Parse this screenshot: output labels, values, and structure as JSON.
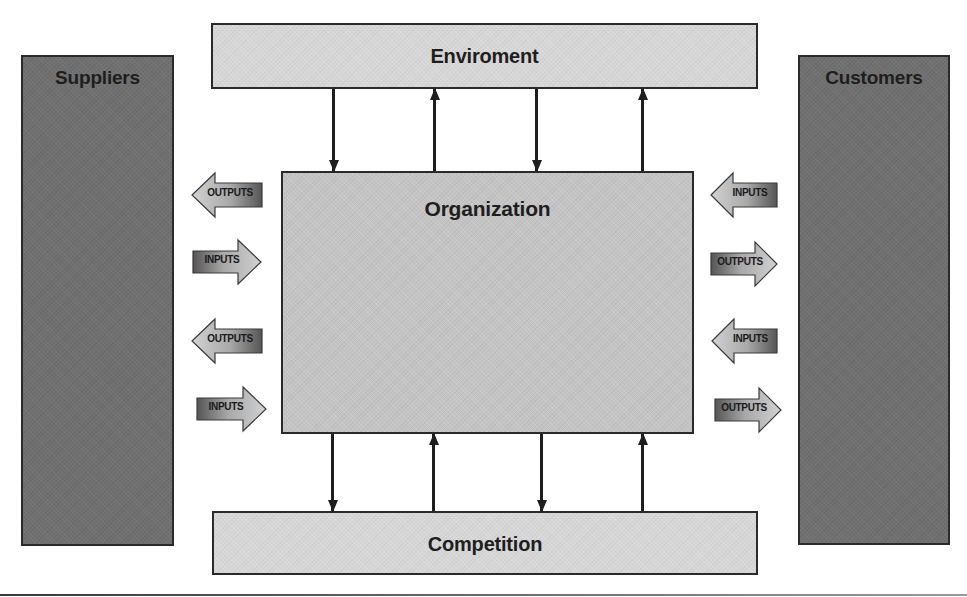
{
  "diagram": {
    "type": "organization-environment system diagram",
    "boxes": {
      "suppliers": {
        "label": "Suppliers"
      },
      "customers": {
        "label": "Customers"
      },
      "environment": {
        "label": "Enviroment"
      },
      "competition": {
        "label": "Competition"
      },
      "organization": {
        "label": "Organization"
      }
    },
    "left_flows": [
      {
        "label": "OUTPUTS",
        "direction": "left"
      },
      {
        "label": "INPUTS",
        "direction": "right"
      },
      {
        "label": "OUTPUTS",
        "direction": "left"
      },
      {
        "label": "INPUTS",
        "direction": "right"
      }
    ],
    "right_flows": [
      {
        "label": "INPUTS",
        "direction": "left"
      },
      {
        "label": "OUTPUTS",
        "direction": "right"
      },
      {
        "label": "INPUTS",
        "direction": "left"
      },
      {
        "label": "OUTPUTS",
        "direction": "right"
      }
    ],
    "environment_connectors": [
      "down",
      "up",
      "down",
      "up"
    ],
    "competition_connectors": [
      "down",
      "up",
      "down",
      "up"
    ],
    "colors": {
      "side_box": "#707070",
      "light_box": "#d6d6d6",
      "organization_box": "#c4c4c4",
      "border": "#2a2a2a",
      "arrow_dark": "#5a5a5a",
      "arrow_light": "#c8c8c8"
    }
  }
}
